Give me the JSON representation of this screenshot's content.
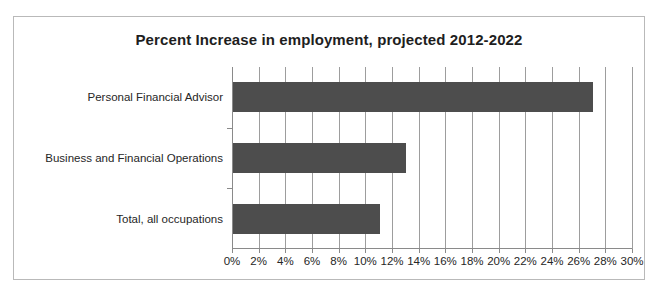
{
  "chart_data": {
    "type": "bar",
    "orientation": "horizontal",
    "title": "Percent Increase in employment, projected 2012-2022",
    "xlabel": "",
    "ylabel": "",
    "categories": [
      "Personal Financial Advisor",
      "Business and Financial Operations",
      "Total, all occupations"
    ],
    "values": [
      27,
      13,
      11
    ],
    "value_unit": "%",
    "xlim": [
      0,
      30
    ],
    "xtick_step": 2,
    "xticks": [
      0,
      2,
      4,
      6,
      8,
      10,
      12,
      14,
      16,
      18,
      20,
      22,
      24,
      26,
      28,
      30
    ],
    "xtick_labels": [
      "0%",
      "2%",
      "4%",
      "6%",
      "8%",
      "10%",
      "12%",
      "14%",
      "16%",
      "18%",
      "20%",
      "22%",
      "24%",
      "26%",
      "28%",
      "30%"
    ],
    "grid": true,
    "grid_axis": "x",
    "legend": false,
    "legend_position": "none",
    "series": [
      {
        "name": "Percent increase",
        "values": [
          27,
          13,
          11
        ]
      }
    ],
    "colors": {
      "bar": "#4d4d4d",
      "gridline": "#9d9d9d",
      "axis": "#8a8a8a",
      "frame": "#b9b9b9",
      "text": "#262626",
      "title": "#1e1e1e",
      "background": "#ffffff"
    }
  }
}
